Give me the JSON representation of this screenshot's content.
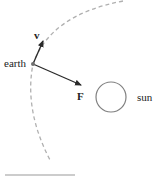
{
  "diagram": {
    "labels": {
      "earth": "earth",
      "sun": "sun",
      "velocity": "v",
      "force": "F"
    },
    "colors": {
      "orbit": "#b0b0b0",
      "arrow": "#2a2a2a",
      "sun_outline": "#808080",
      "earth_dot": "#707070",
      "rule": "#999999"
    }
  }
}
